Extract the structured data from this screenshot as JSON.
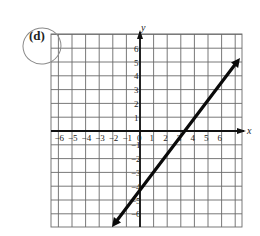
{
  "problem": {
    "label": "(d)",
    "circled": true
  },
  "axes": {
    "x_label": "x",
    "y_label": "y",
    "x_ticks": [
      "-6",
      "-5",
      "-4",
      "-3",
      "-2",
      "-1",
      "0",
      "1",
      "2",
      "3",
      "4",
      "5",
      "6"
    ],
    "y_ticks": [
      "6",
      "5",
      "4",
      "3",
      "2",
      "1",
      "-1",
      "-2",
      "-3",
      "-4",
      "-5",
      "-6"
    ]
  },
  "chart_data": {
    "type": "line",
    "title": "(d)",
    "xlabel": "x",
    "ylabel": "y",
    "xlim": [
      -6.6,
      7.4
    ],
    "ylim": [
      -7,
      7
    ],
    "grid": true,
    "series": [
      {
        "name": "line",
        "description": "Line with arrows at both ends, slope 4/3, y-intercept -4, x-intercept 3",
        "points": [
          [
            -1.5,
            -6
          ],
          [
            0,
            -4
          ],
          [
            3,
            0
          ],
          [
            6,
            4
          ]
        ],
        "equation": "y = (4/3)x - 4"
      }
    ]
  },
  "colors": {
    "grid": "#555555",
    "axis": "#111111",
    "line": "#0a0a0a",
    "circle": "#8a8a8a"
  }
}
